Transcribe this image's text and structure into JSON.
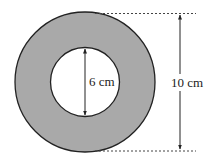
{
  "diagram": {
    "type": "annulus",
    "inner_label": "6 cm",
    "outer_label": "10 cm",
    "inner_diameter_cm": 6,
    "outer_diameter_cm": 10,
    "ring_color": "#a9a9a9",
    "hole_color": "#ffffff",
    "stroke_color": "#222222"
  }
}
